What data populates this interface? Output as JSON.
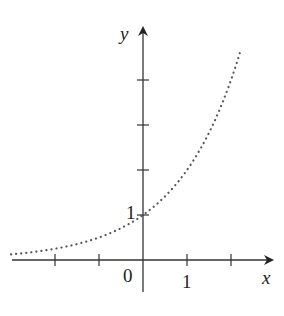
{
  "chart_data": {
    "type": "line",
    "title": "",
    "function": "y = 2^x",
    "xlabel": "x",
    "ylabel": "y",
    "line_style": "dotted",
    "color": "#555555",
    "x": [
      -3,
      -2.5,
      -2,
      -1.5,
      -1,
      -0.5,
      0,
      0.5,
      1,
      1.5,
      2,
      2.2
    ],
    "values": [
      0.125,
      0.177,
      0.25,
      0.354,
      0.5,
      0.707,
      1,
      1.414,
      2,
      2.828,
      4,
      4.6
    ],
    "xlim": [
      -3.2,
      3
    ],
    "ylim": [
      -0.8,
      5.3
    ],
    "x_ticks": [
      -2,
      -1,
      1,
      2
    ],
    "y_ticks": [
      1,
      2,
      3,
      4
    ],
    "tick_labels": {
      "origin": "0",
      "x_one": "1",
      "y_one": "1"
    },
    "grid": false,
    "legend": null
  },
  "labels": {
    "x_axis": "x",
    "y_axis": "y",
    "origin": "0",
    "x_one": "1",
    "y_one": "1"
  }
}
